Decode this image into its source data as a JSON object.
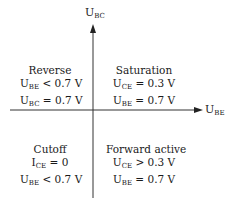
{
  "axes": {
    "y": {
      "main": "U",
      "sub": "BC"
    },
    "x": {
      "main": "U",
      "sub": "BE"
    }
  },
  "quadrants": {
    "top_left": {
      "title": "Reverse",
      "lines": [
        {
          "main": "U",
          "sub": "BE",
          "rest": " < 0.7 V"
        },
        {
          "main": "U",
          "sub": "BC",
          "rest": " = 0.7 V"
        }
      ]
    },
    "top_right": {
      "title": "Saturation",
      "lines": [
        {
          "main": "U",
          "sub": "CE",
          "rest": " = 0.3 V"
        },
        {
          "main": "U",
          "sub": "BE",
          "rest": " = 0.7 V"
        }
      ]
    },
    "bottom_left": {
      "title": "Cutoff",
      "lines": [
        {
          "main": "I",
          "sub": "CE",
          "rest": " = 0"
        },
        {
          "main": "U",
          "sub": "BE",
          "rest": " < 0.7 V"
        }
      ]
    },
    "bottom_right": {
      "title": "Forward active",
      "lines": [
        {
          "main": "U",
          "sub": "CE",
          "rest": " > 0.3 V"
        },
        {
          "main": "U",
          "sub": "BE",
          "rest": " = 0.7 V"
        }
      ]
    }
  }
}
